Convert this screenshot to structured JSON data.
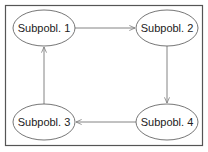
{
  "diagram": {
    "title": "",
    "colors": {
      "frame": "#555555",
      "node_stroke": "#666666",
      "edge": "#777777",
      "text": "#222222",
      "background": "#ffffff"
    },
    "nodes": [
      {
        "id": "n1",
        "label": "Subpobl. 1",
        "cx": 44,
        "cy": 28
      },
      {
        "id": "n2",
        "label": "Subpobl. 2",
        "cx": 167,
        "cy": 28
      },
      {
        "id": "n3",
        "label": "Subpobl. 3",
        "cx": 44,
        "cy": 122
      },
      {
        "id": "n4",
        "label": "Subpobl. 4",
        "cx": 167,
        "cy": 122
      }
    ],
    "edges": [
      {
        "from": "Subpobl. 1",
        "to": "Subpobl. 2",
        "direction": "right"
      },
      {
        "from": "Subpobl. 2",
        "to": "Subpobl. 4",
        "direction": "down"
      },
      {
        "from": "Subpobl. 4",
        "to": "Subpobl. 3",
        "direction": "left"
      },
      {
        "from": "Subpobl. 3",
        "to": "Subpobl. 1",
        "direction": "up"
      }
    ]
  }
}
